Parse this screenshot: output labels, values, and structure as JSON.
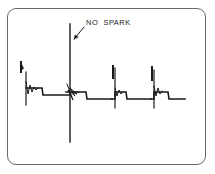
{
  "diagram": {
    "type": "oscilloscope-ignition-secondary-pattern",
    "annotation": {
      "text": "NO  SPARK",
      "points_to": "cylinder-2-firing-line"
    },
    "colors": {
      "trace": "#1a1a1a",
      "frame": "#6a6a6a",
      "background": "#ffffff"
    },
    "traces": [
      {
        "cylinder": 1,
        "firing_line": "normal"
      },
      {
        "cylinder": 2,
        "firing_line": "excessively high (no spark)"
      },
      {
        "cylinder": 3,
        "firing_line": "normal"
      },
      {
        "cylinder": 4,
        "firing_line": "normal"
      }
    ]
  }
}
